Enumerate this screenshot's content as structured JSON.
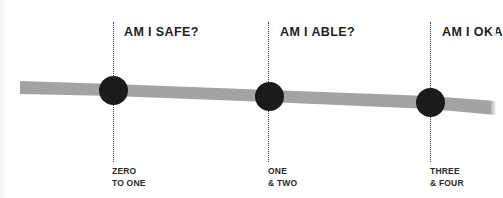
{
  "diagram": {
    "band_color": "#a3a3a3",
    "node_color": "#1b1b1b",
    "milestones": [
      {
        "question": "AM I SAFE?",
        "stage_line1": "ZERO",
        "stage_line2": "TO ONE"
      },
      {
        "question": "AM I ABLE?",
        "stage_line1": "ONE",
        "stage_line2": "& TWO"
      },
      {
        "question": "AM I OKA",
        "stage_line1": "THREE",
        "stage_line2": "& FOUR"
      }
    ]
  }
}
